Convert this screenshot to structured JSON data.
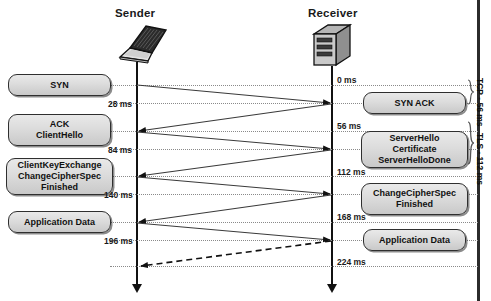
{
  "diagram": {
    "type": "sequence",
    "participants": [
      {
        "id": "sender",
        "label": "Sender",
        "icon": "laptop-icon"
      },
      {
        "id": "receiver",
        "label": "Receiver",
        "icon": "server-icon"
      }
    ],
    "left_messages": [
      {
        "lines": [
          "SYN"
        ]
      },
      {
        "lines": [
          "ACK",
          "ClientHello"
        ]
      },
      {
        "lines": [
          "ClientKeyExchange",
          "ChangeCipherSpec",
          "Finished"
        ]
      },
      {
        "lines": [
          "Application Data"
        ]
      }
    ],
    "right_messages": [
      {
        "lines": [
          "SYN ACK"
        ]
      },
      {
        "lines": [
          "ServerHello",
          "Certificate",
          "ServerHelloDone"
        ]
      },
      {
        "lines": [
          "ChangeCipherSpec",
          "Finished"
        ]
      },
      {
        "lines": [
          "Application Data"
        ]
      }
    ],
    "left_times": [
      "28 ms",
      "84 ms",
      "140 ms",
      "196 ms"
    ],
    "right_times": [
      "0 ms",
      "56 ms",
      "112 ms",
      "168 ms",
      "224 ms"
    ],
    "brackets": [
      {
        "label": "TCP - 56 ms"
      },
      {
        "label": "TLS - 112 ms"
      }
    ],
    "colors": {
      "box_border": "#2f2f2f",
      "box_fill_top": "#e9e9e9",
      "box_fill_bottom": "#c9c9c9",
      "line": "#111111",
      "guide": "#8a8a8a",
      "frame": "#2b2b2b"
    }
  }
}
